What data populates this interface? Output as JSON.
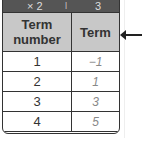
{
  "rule_bar": {
    "operation_1": "× 2",
    "separator": "|",
    "operation_2": "3"
  },
  "table": {
    "headers": [
      "Term number",
      "Term"
    ],
    "rows": [
      {
        "term_number": "1",
        "term": "−1"
      },
      {
        "term_number": "2",
        "term": "1"
      },
      {
        "term_number": "3",
        "term": "3"
      },
      {
        "term_number": "4",
        "term": "5"
      }
    ]
  },
  "pointer": {
    "icon": "left-arrow-icon"
  }
}
